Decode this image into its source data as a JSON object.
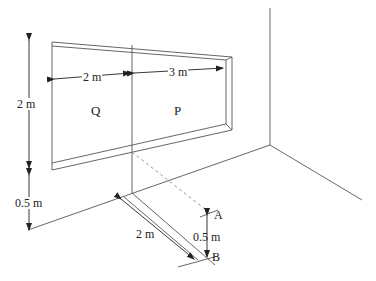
{
  "diagram": {
    "type": "physics-perspective-sketch",
    "colors": {
      "line": "#555555",
      "text": "#222222",
      "dashed": "#888888",
      "background": "#ffffff"
    },
    "labels": {
      "window_height": "2 m",
      "sill_height": "0.5 m",
      "width_q": "2 m",
      "width_p": "3 m",
      "region_q": "Q",
      "region_p": "P",
      "floor_distance": "2 m",
      "ab_distance": "0.5 m",
      "point_a": "A",
      "point_b": "B"
    }
  }
}
